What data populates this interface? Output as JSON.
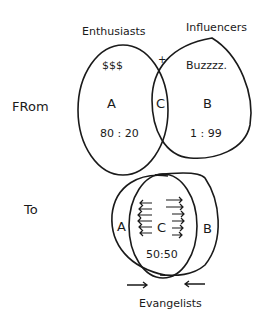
{
  "from_section": {
    "label": "FRom",
    "left_set": {
      "title": "Enthusiasts",
      "symbol": "$$$",
      "name": "A",
      "ratio": "80 : 20"
    },
    "right_set": {
      "title": "Influencers",
      "symbol": "Buzzzz.",
      "name": "B",
      "ratio": "1 : 99"
    },
    "intersection": {
      "name": "C",
      "marker": "+"
    }
  },
  "to_section": {
    "label": "To",
    "left_set": {
      "name": "A"
    },
    "right_set": {
      "name": "B"
    },
    "intersection": {
      "name": "C",
      "ratio": "50:50"
    },
    "caption": "Evangelists",
    "arrows": [
      "right-arrow",
      "left-arrow"
    ]
  },
  "colors": {
    "ink": "#1a1a1a",
    "background": "#ffffff"
  }
}
